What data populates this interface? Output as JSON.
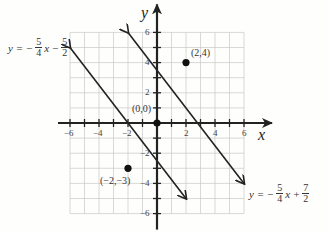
{
  "chart_data": {
    "type": "line",
    "title": "",
    "xlabel": "x",
    "ylabel": "y",
    "xlim": [
      -6,
      6
    ],
    "ylim": [
      -6,
      6
    ],
    "grid": true,
    "x_ticks": [
      "-6",
      "-4",
      "-2",
      "2",
      "4",
      "6"
    ],
    "y_ticks": [
      "6",
      "4",
      "2",
      "-2",
      "-4",
      "-6"
    ],
    "series": [
      {
        "name": "y = -5/4 x - 5/2",
        "slope": -1.25,
        "intercept": -2.5,
        "label": {
          "prefix": "y = −",
          "frac1_num": "5",
          "frac1_den": "4",
          "mid": "x −",
          "frac2_num": "5",
          "frac2_den": "2"
        }
      },
      {
        "name": "y = -5/4 x + 7/2",
        "slope": -1.25,
        "intercept": 3.5,
        "label": {
          "prefix": "y = −",
          "frac1_num": "5",
          "frac1_den": "4",
          "mid": "x +",
          "frac2_num": "7",
          "frac2_den": "2"
        }
      }
    ],
    "points": [
      {
        "x": 0,
        "y": 0,
        "label": "(0,0)"
      },
      {
        "x": 2,
        "y": 4,
        "label": "(2,4)"
      },
      {
        "x": -2,
        "y": -3,
        "label": "(−2,−3)"
      }
    ]
  },
  "axis": {
    "x_name": "x",
    "y_name": "y"
  },
  "ticks": {
    "x": {
      "m6": "−6",
      "m4": "−4",
      "m2": "−2",
      "p2": "2",
      "p4": "4",
      "p6": "6"
    },
    "y": {
      "p6": "6",
      "p4": "4",
      "p2": "2",
      "m2": "−2",
      "m4": "−4",
      "m6": "−6"
    }
  }
}
